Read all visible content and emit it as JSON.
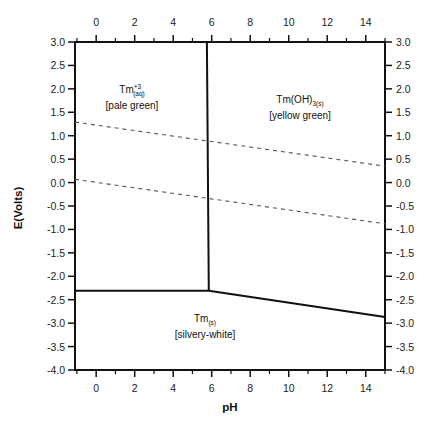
{
  "chart_data": {
    "type": "line",
    "title": "",
    "subtitle": "",
    "xlabel": "pH",
    "ylabel": "E(Volts)",
    "xlim": [
      -1.1,
      15.0
    ],
    "ylim": [
      -4.0,
      3.0
    ],
    "grid": false,
    "legend": null,
    "x_ticks_major": [
      0,
      2,
      4,
      6,
      8,
      10,
      12,
      14
    ],
    "x_ticks_minor": [
      -1,
      1,
      3,
      5,
      7,
      9,
      11,
      13,
      15
    ],
    "y_ticks": [
      3.0,
      2.5,
      2.0,
      1.5,
      1.0,
      0.5,
      0.0,
      -0.5,
      -1.0,
      -1.5,
      -2.0,
      -2.5,
      -3.0,
      -3.5,
      -4.0
    ],
    "y_tick_labels": [
      "3.0",
      "2.5",
      "2.0",
      "1.5",
      "1.0",
      "0.5",
      "0.0",
      "-0.5",
      "-1.0",
      "-1.5",
      "-2.0",
      "-2.5",
      "-3.0",
      "-3.5",
      "-4.0"
    ],
    "mirror_axes": {
      "top_x": true,
      "right_y": true
    },
    "series": [
      {
        "name": "Tm+3/Tm(OH)3 boundary",
        "style": "solid",
        "x": [
          5.75,
          5.85
        ],
        "y": [
          3.0,
          -2.31
        ]
      },
      {
        "name": "Tm+3/Tm boundary",
        "style": "solid",
        "x": [
          -1.1,
          5.85
        ],
        "y": [
          -2.31,
          -2.31
        ]
      },
      {
        "name": "Tm(OH)3/Tm boundary",
        "style": "solid",
        "x": [
          5.85,
          15.0
        ],
        "y": [
          -2.31,
          -2.87
        ]
      },
      {
        "name": "O2/H2O water line",
        "style": "dashed",
        "x": [
          -1.1,
          15.0
        ],
        "y": [
          1.29,
          0.35
        ]
      },
      {
        "name": "H+/H2 water line",
        "style": "dashed",
        "x": [
          -1.1,
          15.0
        ],
        "y": [
          0.07,
          -0.88
        ]
      }
    ],
    "annotations": [
      {
        "species": "Tm",
        "sup": "+3",
        "sub": "(aq)",
        "color_note": "[pale green]",
        "x": 1.0,
        "y": 2.0
      },
      {
        "species": "Tm(OH)",
        "sub": "3(s)",
        "color_note": "[yellow green]",
        "x": 10.5,
        "y": 1.7
      },
      {
        "species": "Tm",
        "sub": "(s)",
        "color_note": "[silvery-white]",
        "x": 6.0,
        "y": -3.05
      }
    ]
  },
  "labels": {
    "tm3": {
      "base": "Tm",
      "sup": "+3",
      "sub": "(aq)",
      "note": "[pale green]"
    },
    "tmoh3": {
      "base": "Tm(OH)",
      "sub": "3(s)",
      "note": "[yellow green]"
    },
    "tm": {
      "base": "Tm",
      "sub": "(s)",
      "note": "[silvery-white]"
    }
  }
}
